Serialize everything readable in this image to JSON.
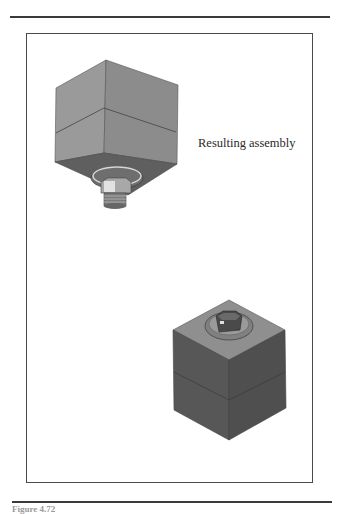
{
  "page": {
    "top_rule": {
      "x1": 10,
      "x2": 330,
      "y": 17
    },
    "bottom_rule": {
      "x1": 12,
      "x2": 332,
      "y": 502
    },
    "caption": "Figure 4.72"
  },
  "figure": {
    "annotation": "Resulting assembly",
    "views": [
      {
        "name": "bottom-up view",
        "description": "Cube with bolt, washer and nut seen from below"
      },
      {
        "name": "top-down view",
        "description": "Cube with bolt head and washer seen from above"
      }
    ],
    "colors": {
      "face_light": "#9c9c9c",
      "face_mid": "#8a8a8a",
      "face_dark": "#5e5e5e",
      "face_darker": "#4e4e4e",
      "frame": "#4a4a4a"
    }
  }
}
